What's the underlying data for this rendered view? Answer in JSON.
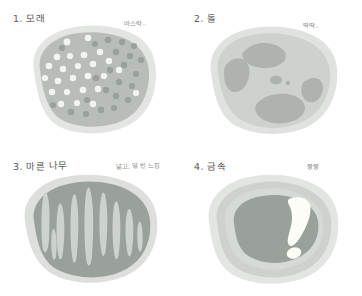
{
  "page": {
    "kind": "hand-drawn-texture-study-sheet",
    "background_color": "#ffffff",
    "panel_count": 4
  },
  "palette": {
    "background": "#ffffff",
    "halo_pale": "#e2e5e2",
    "halo_pale_2": "#dcdfdc",
    "light_grey": "#cdd2cd",
    "mid_grey": "#b9bdb9",
    "mid_grey_2": "#aeb3ae",
    "dark_grey": "#9aa09a",
    "darker_grey": "#8e948e",
    "dot_light": "#f2f4f2",
    "dot_dark": "#9aa09a",
    "highlight_white": "#fdfdf8",
    "title_ink": "#585858",
    "note_ink": "#8c8c8c"
  },
  "panels": [
    {
      "index": 1,
      "title": "1. 모래",
      "note": "바스락..",
      "subject": "sand",
      "texture": "speckled dots scattered over a rounded blob",
      "dot_counts": {
        "light": 24,
        "dark": 22
      }
    },
    {
      "index": 2,
      "title": "2. 돌",
      "note": "딱딱..",
      "subject": "stone",
      "texture": "large irregular darker patches inside a pale rounded blob",
      "patch_count": 6
    },
    {
      "index": 3,
      "title": "3. 마른 나무",
      "note": "넓고, 덜 빈 느낌",
      "subject": "dry wood",
      "texture": "pale vertical lens-shaped grain streaks over a mid-grey blob",
      "streak_count": 9
    },
    {
      "index": 4,
      "title": "4. 금속",
      "note": "짱짱",
      "subject": "metal",
      "texture": "concentric rings with a bright specular comma highlight",
      "highlight_count": 2
    }
  ]
}
